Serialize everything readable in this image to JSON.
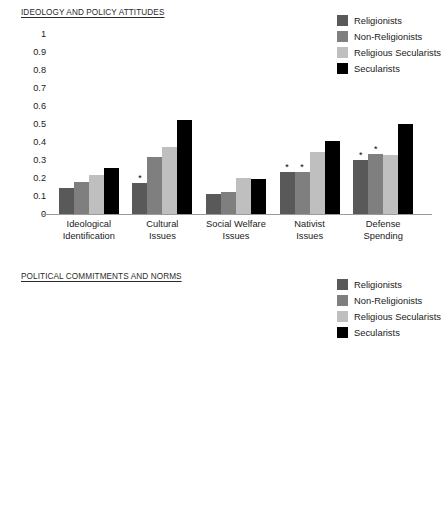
{
  "legend_entries": [
    {
      "label": "Religionists",
      "color": "#595959"
    },
    {
      "label": "Non-Religionists",
      "color": "#7f7f7f"
    },
    {
      "label": "Religious Secularists",
      "color": "#bfbfbf"
    },
    {
      "label": "Secularists",
      "color": "#000000"
    }
  ],
  "chart_data": [
    {
      "type": "bar",
      "title": "IDEOLOGY AND POLICY ATTITUDES",
      "xlabel": "",
      "ylabel": "",
      "ylim": [
        0,
        1
      ],
      "ytick_labels": [
        "1",
        "0.9",
        "0.8",
        "0.7",
        "0.6",
        "0.5",
        "0.4",
        "0.3",
        "0.2",
        "0.1",
        "0"
      ],
      "ytick_values": [
        1,
        0.9,
        0.8,
        0.7,
        0.6,
        0.5,
        0.4,
        0.3,
        0.2,
        0.1,
        0
      ],
      "grid": false,
      "legend_position": "top-right",
      "categories": [
        "Ideological\nIdentification",
        "Cultural\nIssues",
        "Social Welfare\nIssues",
        "Nativist\nIssues",
        "Defense\nSpending"
      ],
      "series": [
        {
          "name": "Religionists",
          "color": "#595959",
          "values": [
            0.145,
            0.17,
            0.11,
            0.235,
            0.3
          ]
        },
        {
          "name": "Non-Religionists",
          "color": "#7f7f7f",
          "values": [
            0.18,
            0.315,
            0.125,
            0.235,
            0.335
          ]
        },
        {
          "name": "Religious Secularists",
          "color": "#bfbfbf",
          "values": [
            0.215,
            0.375,
            0.2,
            0.345,
            0.33
          ]
        },
        {
          "name": "Secularists",
          "color": "#000000",
          "values": [
            0.255,
            0.52,
            0.195,
            0.405,
            0.5
          ]
        }
      ],
      "significance_markers": [
        {
          "category_index": 1,
          "series_index": 0,
          "symbol": "*"
        },
        {
          "category_index": 3,
          "series_index": 0,
          "symbol": "*"
        },
        {
          "category_index": 3,
          "series_index": 1,
          "symbol": "*"
        },
        {
          "category_index": 4,
          "series_index": 0,
          "symbol": "*"
        },
        {
          "category_index": 4,
          "series_index": 1,
          "symbol": "*"
        }
      ]
    },
    {
      "type": "bar",
      "title": "POLITICAL COMMITMENTS AND NORMS",
      "xlabel": "",
      "ylabel": "",
      "ylim": [
        0,
        1
      ],
      "ytick_labels": [
        "1",
        "0.9",
        "0.8",
        "0.7",
        "0.6",
        "0.5",
        "0.4",
        "0.3",
        "0.2",
        "0.1",
        "0"
      ],
      "ytick_values": [
        1,
        0.9,
        0.8,
        0.7,
        0.6,
        0.5,
        0.4,
        0.3,
        0.2,
        0.1,
        0
      ],
      "grid": false,
      "legend_position": "top-right",
      "categories": [
        "Party\nCommitment",
        "Ideological\nCommitment",
        "Purist Norms",
        "Support for\nInterparty\nCompromise"
      ],
      "series": [
        {
          "name": "Religionists",
          "color": "#595959",
          "values": [
            0.62,
            0.815,
            0.605,
            0.36
          ]
        },
        {
          "name": "Non-Religionists",
          "color": "#7f7f7f",
          "values": [
            0.575,
            0.79,
            0.565,
            0.42
          ]
        },
        {
          "name": "Religious Secularists",
          "color": "#bfbfbf",
          "values": [
            0.54,
            0.82,
            0.56,
            0.47
          ]
        },
        {
          "name": "Secularists",
          "color": "#000000",
          "values": [
            0.54,
            0.805,
            0.505,
            0.57
          ]
        }
      ],
      "significance_markers": [
        {
          "category_index": 2,
          "series_index": 0,
          "symbol": "*"
        },
        {
          "category_index": 2,
          "series_index": 1,
          "symbol": "*"
        }
      ]
    }
  ]
}
